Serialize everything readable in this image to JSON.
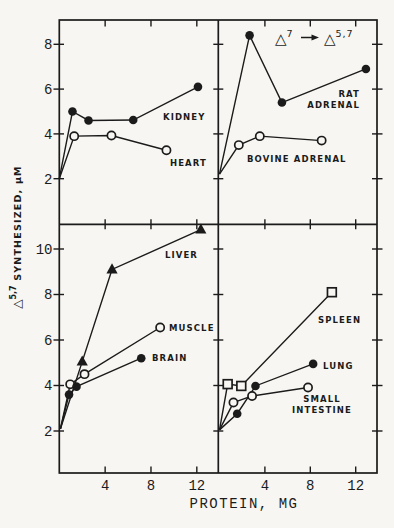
{
  "figure": {
    "background": "#f7f6f2",
    "ink": "#1b1b1b",
    "kind": "four-panel scientific line chart, scanned grayscale"
  },
  "chart_data": {
    "type": "line",
    "title": "",
    "xlabel": "PROTEIN, MG",
    "ylabel": {
      "symbol": "△",
      "superscript": "5,7",
      "rest": " SYNTHESIZED, μM"
    },
    "annotation": {
      "lhs_symbol": "△",
      "lhs_sup": "7",
      "rhs_symbol": "△",
      "rhs_sup": "5,7"
    },
    "x_ticks": [
      4,
      8,
      12
    ],
    "grid": false,
    "legend": "labels drawn inside panels next to each curve",
    "panels": [
      {
        "id": "top-left",
        "row": "top",
        "col": "left",
        "y_ticks": [
          2,
          4,
          6,
          8
        ],
        "ylim": [
          0,
          9.1
        ],
        "xlim": [
          0,
          13.9
        ],
        "series": [
          {
            "name": "KIDNEY",
            "marker": "filled-circle",
            "points": [
              [
                0,
                2.0
              ],
              [
                1.15,
                5.0
              ],
              [
                2.55,
                4.6
              ],
              [
                6.45,
                4.62
              ],
              [
                12.1,
                6.1
              ]
            ],
            "label": {
              "lines": [
                "KIDNEY"
              ],
              "x": 163,
              "y": 119.5,
              "anchor": "start"
            }
          },
          {
            "name": "HEART",
            "marker": "open-circle",
            "points": [
              [
                0,
                2.0
              ],
              [
                1.3,
                3.9
              ],
              [
                4.55,
                3.93
              ],
              [
                9.35,
                3.27
              ]
            ],
            "label": {
              "lines": [
                "HEART"
              ],
              "x": 170,
              "y": 165.5,
              "anchor": "start"
            }
          }
        ]
      },
      {
        "id": "top-right",
        "row": "top",
        "col": "right",
        "y_ticks": [
          2,
          4,
          6,
          8
        ],
        "ylim": [
          0,
          9.1
        ],
        "xlim": [
          0,
          13.9
        ],
        "series": [
          {
            "name": "RAT ADRENAL",
            "marker": "filled-circle",
            "points": [
              [
                0,
                2.2
              ],
              [
                2.65,
                8.4
              ],
              [
                5.5,
                5.4
              ],
              [
                12.9,
                6.9
              ]
            ],
            "label": {
              "lines": [
                "RAT",
                "ADRENAL"
              ],
              "x": 360,
              "y": 97,
              "anchor": "end",
              "line_height": 10.5
            }
          },
          {
            "name": "BOVINE ADRENAL",
            "marker": "open-circle",
            "points": [
              [
                0,
                2.2
              ],
              [
                1.7,
                3.5
              ],
              [
                3.55,
                3.9
              ],
              [
                9.0,
                3.7
              ]
            ],
            "label": {
              "lines": [
                "BOVINE ADRENAL"
              ],
              "x": 247,
              "y": 162,
              "anchor": "start"
            }
          }
        ]
      },
      {
        "id": "bottom-left",
        "row": "bottom",
        "col": "left",
        "y_ticks": [
          2,
          4,
          6,
          8,
          10
        ],
        "ylim": [
          0,
          11.1
        ],
        "xlim": [
          0,
          13.9
        ],
        "series": [
          {
            "name": "LIVER",
            "marker": "filled-triangle",
            "points": [
              [
                0.1,
                2.1
              ],
              [
                2.0,
                5.05
              ],
              [
                4.6,
                9.1
              ],
              [
                12.35,
                10.85
              ]
            ],
            "label": {
              "lines": [
                "LIVER"
              ],
              "x": 165,
              "y": 257.5,
              "anchor": "start"
            }
          },
          {
            "name": "MUSCLE",
            "marker": "open-circle",
            "points": [
              [
                0.1,
                2.1
              ],
              [
                0.95,
                4.05
              ],
              [
                2.2,
                4.5
              ],
              [
                8.8,
                6.55
              ]
            ],
            "label": {
              "lines": [
                "MUSCLE"
              ],
              "x": 169,
              "y": 330.5,
              "anchor": "start"
            }
          },
          {
            "name": "BRAIN",
            "marker": "filled-circle",
            "points": [
              [
                0.1,
                2.1
              ],
              [
                0.85,
                3.6
              ],
              [
                1.5,
                3.95
              ],
              [
                7.15,
                5.2
              ]
            ],
            "label": {
              "lines": [
                "BRAIN"
              ],
              "x": 152,
              "y": 360.5,
              "anchor": "start"
            }
          }
        ]
      },
      {
        "id": "bottom-right",
        "row": "bottom",
        "col": "right",
        "y_ticks": [
          2,
          4,
          6,
          8,
          10
        ],
        "ylim": [
          0,
          11.1
        ],
        "xlim": [
          0,
          13.9
        ],
        "series": [
          {
            "name": "SPLEEN",
            "marker": "open-square",
            "points": [
              [
                0,
                2.05
              ],
              [
                0.72,
                4.06
              ],
              [
                1.92,
                3.98
              ],
              [
                9.9,
                8.1
              ]
            ],
            "label": {
              "lines": [
                "SPLEEN"
              ],
              "x": 318,
              "y": 322.5,
              "anchor": "start"
            }
          },
          {
            "name": "LUNG",
            "marker": "filled-circle",
            "points": [
              [
                0,
                2.05
              ],
              [
                1.56,
                2.76
              ],
              [
                3.17,
                3.98
              ],
              [
                8.25,
                4.95
              ]
            ],
            "label": {
              "lines": [
                "LUNG"
              ],
              "x": 323,
              "y": 368.5,
              "anchor": "start"
            }
          },
          {
            "name": "SMALL INTESTINE",
            "marker": "open-circle",
            "points": [
              [
                0,
                2.05
              ],
              [
                1.23,
                3.25
              ],
              [
                2.87,
                3.54
              ],
              [
                7.8,
                3.91
              ]
            ],
            "label": {
              "lines": [
                "SMALL",
                "INTESTINE"
              ],
              "x": 322,
              "y": 401.5,
              "anchor": "middle",
              "line_height": 11.5
            }
          }
        ]
      }
    ]
  }
}
